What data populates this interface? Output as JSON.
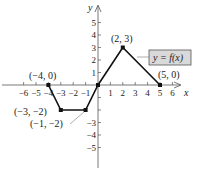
{
  "chart_data": {
    "type": "line",
    "title": "",
    "xlabel": "x",
    "ylabel": "y",
    "xlim": [
      -6,
      6
    ],
    "ylim": [
      -5,
      5
    ],
    "grid": false,
    "x_ticks": [
      -6,
      -5,
      -4,
      -3,
      -2,
      -1,
      1,
      2,
      3,
      4,
      5,
      6
    ],
    "y_ticks": [
      -5,
      -4,
      -3,
      -2,
      -1,
      1,
      2,
      3,
      4,
      5
    ],
    "x_tick_labels": [
      "−6",
      "−5",
      "−4",
      "−3",
      "−2",
      "−1",
      "1",
      "2",
      "3",
      "4",
      "5",
      "6"
    ],
    "y_tick_labels": [
      "−5",
      "−4",
      "−3",
      "",
      "",
      "1",
      "2",
      "3",
      "4",
      "5"
    ],
    "series": [
      {
        "name": "y = f(x)",
        "x": [
          -4,
          -3,
          -1,
          0,
          2,
          5
        ],
        "y": [
          0,
          -2,
          -2,
          0,
          3,
          0
        ],
        "color": "#111111"
      }
    ],
    "annotations": [
      {
        "text": "(−4, 0)",
        "x": -4,
        "y": 0
      },
      {
        "text": "(−3, −2)",
        "x": -3,
        "y": -2
      },
      {
        "text": "(−1, −2)",
        "x": -1,
        "y": -2
      },
      {
        "text": "(2, 3)",
        "x": 2,
        "y": 3
      },
      {
        "text": "(5, 0)",
        "x": 5,
        "y": 0
      }
    ],
    "legend": {
      "text": "y = f(x)",
      "position": "right",
      "box_fill": "#d9d9d9",
      "box_stroke": "#555555"
    }
  },
  "labels": {
    "x_axis": "x",
    "y_axis": "y",
    "function": "y = f(x)",
    "p1": "(−4, 0)",
    "p2": "(−3, −2)",
    "p3": "(−1, −2)",
    "p4": "(2, 3)",
    "p5": "(5, 0)"
  }
}
